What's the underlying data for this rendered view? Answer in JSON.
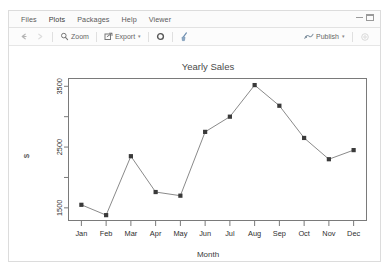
{
  "window": {
    "minimize_icon": "minimize-icon",
    "maximize_icon": "maximize-icon"
  },
  "tabs": [
    {
      "label": "Files",
      "icon": "files-icon"
    },
    {
      "label": "Plots",
      "icon": "plots-icon"
    },
    {
      "label": "Packages",
      "icon": "packages-icon"
    },
    {
      "label": "Help",
      "icon": "help-icon"
    },
    {
      "label": "Viewer",
      "icon": "viewer-icon"
    }
  ],
  "active_tab": "Plots",
  "toolbar": {
    "back_icon": "back-arrow-icon",
    "forward_icon": "forward-arrow-icon",
    "zoom_label": "Zoom",
    "zoom_icon": "magnifier-icon",
    "export_label": "Export",
    "export_icon": "export-icon",
    "export_caret": "▾",
    "remove_icon": "remove-plot-icon",
    "clear_icon": "broom-icon",
    "publish_label": "Publish",
    "publish_icon": "publish-icon",
    "publish_caret": "▾",
    "settings_icon": "gear-icon"
  },
  "chart_data": {
    "type": "line",
    "title": "Yearly Sales",
    "xlabel": "Month",
    "ylabel": "$",
    "categories": [
      "Jan",
      "Feb",
      "Mar",
      "Apr",
      "May",
      "Jun",
      "Jul",
      "Aug",
      "Sep",
      "Oct",
      "Nov",
      "Dec"
    ],
    "values": [
      1550,
      1380,
      2350,
      1760,
      1700,
      2750,
      3000,
      3520,
      3180,
      2650,
      2300,
      2450
    ],
    "ylim": [
      1300,
      3620
    ],
    "yticks": [
      1500,
      2000,
      2500,
      3000,
      3500
    ],
    "ytick_labels": [
      "1500",
      "2500",
      "3500"
    ],
    "ytick_labels_shown": [
      1500,
      2500,
      3500
    ],
    "grid": false,
    "legend": false,
    "marker": "square",
    "line_color": "#8a8a8a",
    "marker_color": "#3a3a3a"
  }
}
